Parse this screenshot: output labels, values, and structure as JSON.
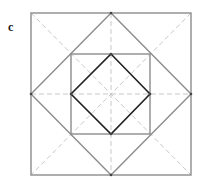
{
  "figure": {
    "panel_label": "c",
    "clipped_caption": "",
    "colors": {
      "background": "#ffffff",
      "outer_lines": "#8c8c8c",
      "guide_dashes": "#c8c8c8",
      "inner_diamond": "#222222",
      "vertex_dots": "#444444"
    },
    "shapes": {
      "outer_square": {
        "x1": 31,
        "y1": 13,
        "x2": 191,
        "y2": 175
      },
      "outer_diamond": {
        "points": "111,13 191,94 111,175 31,94"
      },
      "middle_square": {
        "x1": 71,
        "y1": 54,
        "x2": 150,
        "y2": 134
      },
      "inner_diamond": {
        "points": "111,54 150,94 111,134 71,94"
      },
      "guides": [
        {
          "name": "diagonal-main",
          "x1": 31,
          "y1": 13,
          "x2": 191,
          "y2": 175
        },
        {
          "name": "diagonal-anti",
          "x1": 191,
          "y1": 13,
          "x2": 31,
          "y2": 175
        },
        {
          "name": "horizontal-midline",
          "x1": 31,
          "y1": 94,
          "x2": 191,
          "y2": 94
        },
        {
          "name": "vertical-midline",
          "x1": 111,
          "y1": 13,
          "x2": 111,
          "y2": 175
        }
      ],
      "vertex_dots": [
        {
          "cx": 111,
          "cy": 54
        },
        {
          "cx": 150,
          "cy": 94
        },
        {
          "cx": 111,
          "cy": 134
        },
        {
          "cx": 71,
          "cy": 94
        },
        {
          "cx": 31,
          "cy": 94
        },
        {
          "cx": 191,
          "cy": 94
        },
        {
          "cx": 111,
          "cy": 13
        },
        {
          "cx": 111,
          "cy": 175
        }
      ]
    }
  }
}
